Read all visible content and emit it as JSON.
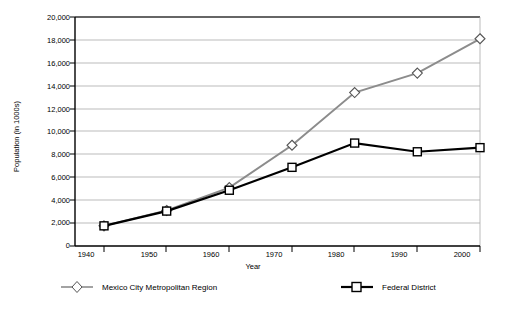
{
  "chart_data": {
    "type": "line",
    "title": "",
    "xlabel": "Year",
    "ylabel": "Population (in 1000s)",
    "x": [
      1940,
      1950,
      1960,
      1970,
      1980,
      1990,
      2000
    ],
    "xticklabels": [
      "1940",
      "1950",
      "1960",
      "1970",
      "1980",
      "1990",
      "2000"
    ],
    "xlim": [
      1935,
      2005
    ],
    "ylim": [
      0,
      20000
    ],
    "yticks": [
      0,
      2000,
      4000,
      6000,
      8000,
      10000,
      12000,
      14000,
      16000,
      18000,
      20000
    ],
    "yticklabels": [
      "0",
      "2,000",
      "4,000",
      "6,000",
      "8,000",
      "10,000",
      "12,000",
      "14,000",
      "16,000",
      "18,000",
      "20,000"
    ],
    "grid": "horizontal",
    "legend_position": "bottom",
    "series": [
      {
        "name": "Mexico City Metropolitan Region",
        "color": "#8c8c8c",
        "marker": "diamond",
        "values": [
          1760,
          3100,
          5100,
          8800,
          13400,
          15100,
          18100
        ]
      },
      {
        "name": "Federal District",
        "color": "#000000",
        "marker": "square",
        "values": [
          1760,
          3050,
          4870,
          6870,
          8990,
          8230,
          8590
        ]
      }
    ]
  },
  "legend": {
    "items": [
      {
        "label": "Mexico City Metropolitan Region",
        "marker": "diamond-marker-icon"
      },
      {
        "label": "Federal District",
        "marker": "square-marker-icon"
      }
    ]
  },
  "colors": {
    "metro_line": "#8c8c8c",
    "federal_line": "#000000",
    "gridline": "#aaaaaa",
    "axis": "#000000",
    "marker_fill": "#ffffff",
    "background": "#ffffff"
  }
}
